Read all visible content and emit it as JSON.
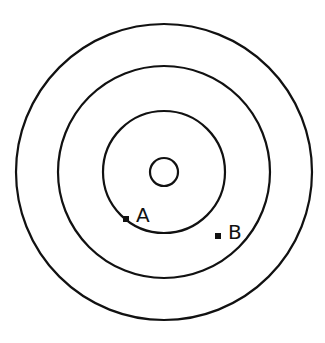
{
  "diagram": {
    "center": {
      "x": 164,
      "y": 172
    },
    "circles": [
      {
        "name": "center-circle",
        "r": 14
      },
      {
        "name": "inner-ring",
        "r": 61
      },
      {
        "name": "middle-ring",
        "r": 106
      },
      {
        "name": "outer-ring",
        "r": 148
      }
    ],
    "points": [
      {
        "label": "A",
        "x": 126,
        "y": 219
      },
      {
        "label": "B",
        "x": 218,
        "y": 236
      }
    ],
    "stroke_color": "#111111"
  }
}
